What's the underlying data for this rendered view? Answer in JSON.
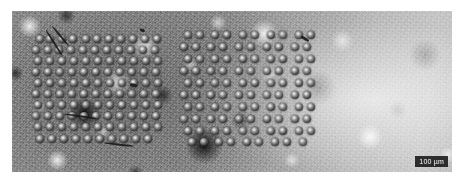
{
  "figure": {
    "kind": "micrograph",
    "modality": "optical-reflected-light-micrograph",
    "canvas": {
      "width": 463,
      "height": 184,
      "background": "#ffffff"
    },
    "frame": {
      "x": 12,
      "y": 11,
      "width": 440,
      "height": 161
    }
  },
  "scalebar": {
    "label": "100 µm",
    "value": 100,
    "unit": "µm",
    "bar_color": "#161616",
    "text_color": "#ffffff",
    "position": "bottom-right"
  },
  "substrate": {
    "base_color": "#8d8d8d",
    "light_region_color": "#d8d8d8",
    "dark_region_color": "#6e6e6e",
    "texture": "mottled-grainy"
  },
  "beads": {
    "diameter_px": 8,
    "highlight_color": "#f2f2f2",
    "rim_color": "#101010",
    "count_total": 193,
    "arrays": [
      {
        "name": "left-array",
        "count": 101,
        "bounds": {
          "x": 20,
          "y": 17,
          "width": 138,
          "height": 120
        }
      },
      {
        "name": "right-array",
        "count": 92,
        "bounds": {
          "x": 168,
          "y": 17,
          "width": 142,
          "height": 120
        }
      }
    ]
  },
  "artifacts": [
    {
      "name": "fiber-streak-top-left",
      "x": 34,
      "y": 18,
      "length": 30,
      "angle": 58
    },
    {
      "name": "fiber-streak-top-left-2",
      "x": 40,
      "y": 14,
      "length": 26,
      "angle": 50
    },
    {
      "name": "debris-speck-top",
      "x": 128,
      "y": 17,
      "length": 5,
      "angle": 20
    },
    {
      "name": "debris-speck-mid",
      "x": 118,
      "y": 72,
      "length": 7,
      "angle": 10
    },
    {
      "name": "scratch-mid-left",
      "x": 52,
      "y": 102,
      "length": 34,
      "angle": 8
    },
    {
      "name": "scratch-lower-left",
      "x": 92,
      "y": 131,
      "length": 30,
      "angle": 6
    },
    {
      "name": "debris-speck-right",
      "x": 289,
      "y": 24,
      "length": 9,
      "angle": 30
    }
  ],
  "chart_data": {
    "type": "scatter",
    "title": "",
    "xlabel": "",
    "ylabel": "",
    "grid": false,
    "legend": null,
    "units": "µm",
    "scalebar_um": 100,
    "series": [
      {
        "name": "left-array",
        "marker": "bead",
        "points_px": [
          [
            28,
            28
          ],
          [
            38,
            28
          ],
          [
            50,
            28
          ],
          [
            61,
            28
          ],
          [
            74,
            28
          ],
          [
            85,
            28
          ],
          [
            97,
            28
          ],
          [
            109,
            28
          ],
          [
            121,
            28
          ],
          [
            133,
            28
          ],
          [
            145,
            28
          ],
          [
            24,
            39
          ],
          [
            36,
            39
          ],
          [
            47,
            39
          ],
          [
            59,
            39
          ],
          [
            71,
            39
          ],
          [
            83,
            39
          ],
          [
            95,
            39
          ],
          [
            107,
            39
          ],
          [
            119,
            39
          ],
          [
            131,
            39
          ],
          [
            143,
            39
          ],
          [
            26,
            50
          ],
          [
            38,
            50
          ],
          [
            50,
            50
          ],
          [
            62,
            50
          ],
          [
            74,
            50
          ],
          [
            86,
            50
          ],
          [
            98,
            50
          ],
          [
            110,
            50
          ],
          [
            122,
            50
          ],
          [
            134,
            50
          ],
          [
            146,
            50
          ],
          [
            24,
            61
          ],
          [
            36,
            61
          ],
          [
            48,
            61
          ],
          [
            60,
            61
          ],
          [
            72,
            61
          ],
          [
            84,
            61
          ],
          [
            96,
            61
          ],
          [
            108,
            61
          ],
          [
            120,
            61
          ],
          [
            132,
            61
          ],
          [
            144,
            61
          ],
          [
            26,
            72
          ],
          [
            38,
            72
          ],
          [
            50,
            72
          ],
          [
            62,
            72
          ],
          [
            74,
            72
          ],
          [
            86,
            72
          ],
          [
            98,
            72
          ],
          [
            110,
            72
          ],
          [
            122,
            72
          ],
          [
            134,
            72
          ],
          [
            146,
            72
          ],
          [
            24,
            83
          ],
          [
            36,
            83
          ],
          [
            48,
            83
          ],
          [
            60,
            83
          ],
          [
            72,
            83
          ],
          [
            84,
            83
          ],
          [
            96,
            83
          ],
          [
            108,
            83
          ],
          [
            120,
            83
          ],
          [
            132,
            83
          ],
          [
            144,
            83
          ],
          [
            26,
            94
          ],
          [
            38,
            94
          ],
          [
            50,
            94
          ],
          [
            62,
            94
          ],
          [
            74,
            94
          ],
          [
            86,
            94
          ],
          [
            98,
            94
          ],
          [
            110,
            94
          ],
          [
            122,
            94
          ],
          [
            134,
            94
          ],
          [
            146,
            94
          ],
          [
            24,
            105
          ],
          [
            36,
            105
          ],
          [
            48,
            105
          ],
          [
            60,
            105
          ],
          [
            72,
            105
          ],
          [
            84,
            105
          ],
          [
            96,
            105
          ],
          [
            108,
            105
          ],
          [
            120,
            105
          ],
          [
            132,
            105
          ],
          [
            144,
            105
          ],
          [
            26,
            116
          ],
          [
            38,
            116
          ],
          [
            50,
            116
          ],
          [
            62,
            116
          ],
          [
            74,
            116
          ],
          [
            86,
            116
          ],
          [
            98,
            116
          ],
          [
            110,
            116
          ],
          [
            122,
            116
          ],
          [
            134,
            116
          ],
          [
            146,
            116
          ],
          [
            28,
            128
          ],
          [
            40,
            128
          ],
          [
            52,
            128
          ],
          [
            64,
            128
          ],
          [
            76,
            128
          ],
          [
            88,
            128
          ],
          [
            100,
            128
          ],
          [
            112,
            128
          ],
          [
            124,
            128
          ],
          [
            136,
            128
          ]
        ]
      },
      {
        "name": "right-array",
        "marker": "bead",
        "points_px": [
          [
            176,
            24
          ],
          [
            188,
            24
          ],
          [
            203,
            24
          ],
          [
            215,
            24
          ],
          [
            231,
            24
          ],
          [
            243,
            24
          ],
          [
            259,
            24
          ],
          [
            271,
            24
          ],
          [
            287,
            24
          ],
          [
            299,
            24
          ],
          [
            172,
            36
          ],
          [
            184,
            36
          ],
          [
            199,
            36
          ],
          [
            211,
            36
          ],
          [
            227,
            36
          ],
          [
            239,
            36
          ],
          [
            255,
            36
          ],
          [
            267,
            36
          ],
          [
            283,
            36
          ],
          [
            295,
            36
          ],
          [
            176,
            48
          ],
          [
            188,
            48
          ],
          [
            203,
            48
          ],
          [
            215,
            48
          ],
          [
            231,
            48
          ],
          [
            243,
            48
          ],
          [
            259,
            48
          ],
          [
            271,
            48
          ],
          [
            287,
            48
          ],
          [
            299,
            48
          ],
          [
            172,
            60
          ],
          [
            184,
            60
          ],
          [
            199,
            60
          ],
          [
            211,
            60
          ],
          [
            227,
            60
          ],
          [
            239,
            60
          ],
          [
            255,
            60
          ],
          [
            267,
            60
          ],
          [
            283,
            60
          ],
          [
            295,
            60
          ],
          [
            176,
            72
          ],
          [
            188,
            72
          ],
          [
            203,
            72
          ],
          [
            215,
            72
          ],
          [
            231,
            72
          ],
          [
            243,
            72
          ],
          [
            259,
            72
          ],
          [
            271,
            72
          ],
          [
            287,
            72
          ],
          [
            299,
            72
          ],
          [
            172,
            84
          ],
          [
            184,
            84
          ],
          [
            199,
            84
          ],
          [
            211,
            84
          ],
          [
            227,
            84
          ],
          [
            239,
            84
          ],
          [
            255,
            84
          ],
          [
            267,
            84
          ],
          [
            283,
            84
          ],
          [
            295,
            84
          ],
          [
            176,
            96
          ],
          [
            188,
            96
          ],
          [
            203,
            96
          ],
          [
            215,
            96
          ],
          [
            231,
            96
          ],
          [
            243,
            96
          ],
          [
            259,
            96
          ],
          [
            271,
            96
          ],
          [
            287,
            96
          ],
          [
            299,
            96
          ],
          [
            172,
            108
          ],
          [
            184,
            108
          ],
          [
            199,
            108
          ],
          [
            211,
            108
          ],
          [
            227,
            108
          ],
          [
            239,
            108
          ],
          [
            255,
            108
          ],
          [
            267,
            108
          ],
          [
            283,
            108
          ],
          [
            295,
            108
          ],
          [
            176,
            120
          ],
          [
            188,
            120
          ],
          [
            203,
            120
          ],
          [
            215,
            120
          ],
          [
            231,
            120
          ],
          [
            243,
            120
          ],
          [
            259,
            120
          ],
          [
            271,
            120
          ],
          [
            287,
            120
          ],
          [
            299,
            120
          ],
          [
            180,
            131
          ],
          [
            192,
            131
          ],
          [
            207,
            131
          ],
          [
            219,
            131
          ],
          [
            235,
            131
          ],
          [
            247,
            131
          ],
          [
            263,
            131
          ],
          [
            275,
            131
          ],
          [
            291,
            131
          ]
        ]
      }
    ]
  }
}
